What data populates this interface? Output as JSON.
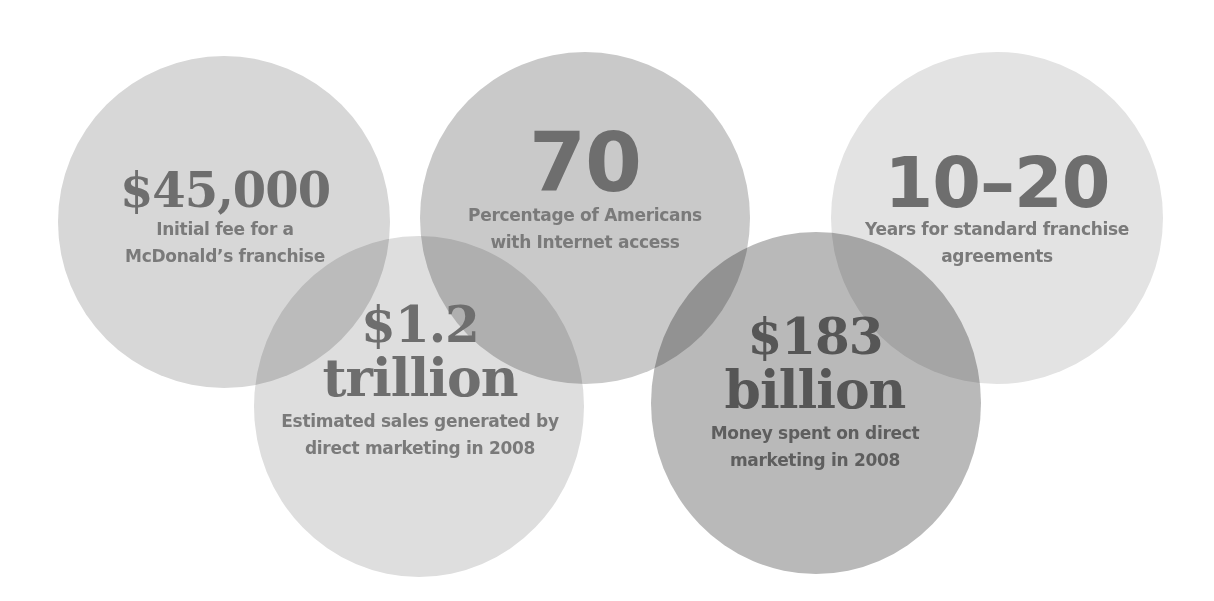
{
  "stats": [
    {
      "id": "franchise-fee",
      "value": "$45,000",
      "value_line2": "",
      "caption_line1": "Initial fee for a",
      "caption_line2": "McDonald’s franchise",
      "fill": "#d7d7d7"
    },
    {
      "id": "internet-access",
      "value": "70",
      "value_line2": "",
      "caption_line1": "Percentage of Americans",
      "caption_line2": "with Internet access",
      "fill": "#c9c9c9"
    },
    {
      "id": "franchise-years",
      "value": "10–20",
      "value_line2": "",
      "caption_line1": "Years for standard franchise",
      "caption_line2": "agreements",
      "fill": "#e3e3e3"
    },
    {
      "id": "direct-marketing-sales",
      "value": "$1.2",
      "value_line2": "trillion",
      "caption_line1": "Estimated sales generated by",
      "caption_line2": "direct marketing in 2008",
      "fill": "#dedede"
    },
    {
      "id": "direct-marketing-spend",
      "value": "$183",
      "value_line2": "billion",
      "caption_line1": "Money spent on direct",
      "caption_line2": "marketing in 2008",
      "fill": "#b9b9b9"
    }
  ],
  "colors": {
    "text_big": "#6e6e6e",
    "text_caption": "#7a7a7a",
    "text_dark": "#565656",
    "background": "#ffffff"
  }
}
